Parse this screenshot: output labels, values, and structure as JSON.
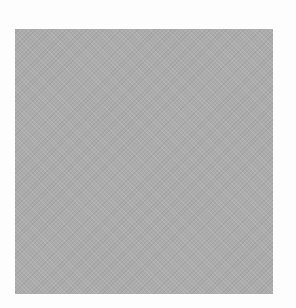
{
  "page": {
    "background": "#fdfdfd"
  },
  "patch": {
    "shape": "square",
    "color": "#acacac",
    "texture": "halftone"
  }
}
